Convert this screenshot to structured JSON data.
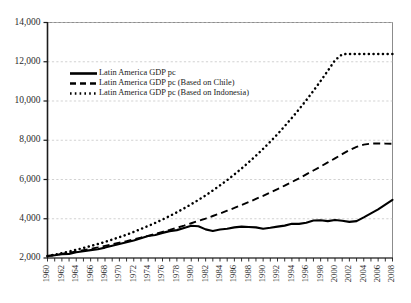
{
  "chart_data": {
    "type": "line",
    "title": "",
    "xlabel": "",
    "ylabel": "",
    "xlim": [
      1960,
      2008
    ],
    "ylim": [
      2000,
      14000
    ],
    "ytick_values": [
      2000,
      4000,
      6000,
      8000,
      10000,
      12000,
      14000
    ],
    "ytick_labels": [
      "2,000",
      "4,000",
      "6,000",
      "8,000",
      "10,000",
      "12,000",
      "14,000"
    ],
    "xtick_labels": [
      "1960",
      "1962",
      "1964",
      "1966",
      "1968",
      "1970",
      "1972",
      "1974",
      "1976",
      "1978",
      "1980",
      "1982",
      "1984",
      "1986",
      "1988",
      "1990",
      "1992",
      "1994",
      "1996",
      "1998",
      "2000",
      "2002",
      "2004",
      "2006",
      "2008"
    ],
    "xtick_label_years": [
      1960,
      1962,
      1964,
      1966,
      1968,
      1970,
      1972,
      1974,
      1976,
      1978,
      1980,
      1982,
      1984,
      1986,
      1988,
      1990,
      1992,
      1994,
      1996,
      1998,
      2000,
      2002,
      2004,
      2006,
      2008
    ],
    "x": [
      1960,
      1961,
      1962,
      1963,
      1964,
      1965,
      1966,
      1967,
      1968,
      1969,
      1970,
      1971,
      1972,
      1973,
      1974,
      1975,
      1976,
      1977,
      1978,
      1979,
      1980,
      1981,
      1982,
      1983,
      1984,
      1985,
      1986,
      1987,
      1988,
      1989,
      1990,
      1991,
      1992,
      1993,
      1994,
      1995,
      1996,
      1997,
      1998,
      1999,
      2000,
      2001,
      2002,
      2003,
      2004,
      2005,
      2006,
      2007,
      2008
    ],
    "grid": "horizontal-dashed",
    "legend_position": "upper-left-inset",
    "series": [
      {
        "name": "Latin America GDP pc",
        "style": "solid",
        "values": [
          2100,
          2140,
          2190,
          2210,
          2290,
          2340,
          2400,
          2450,
          2530,
          2620,
          2710,
          2800,
          2890,
          3010,
          3120,
          3170,
          3280,
          3370,
          3420,
          3530,
          3640,
          3620,
          3460,
          3380,
          3450,
          3490,
          3560,
          3600,
          3580,
          3560,
          3490,
          3540,
          3600,
          3650,
          3740,
          3740,
          3800,
          3910,
          3920,
          3880,
          3940,
          3900,
          3840,
          3880,
          4070,
          4270,
          4480,
          4720,
          4960
        ]
      },
      {
        "name": "Latin America GDP pc (Based on Chile)",
        "style": "dashed",
        "values": [
          2100,
          2150,
          2210,
          2270,
          2330,
          2400,
          2470,
          2540,
          2620,
          2700,
          2780,
          2860,
          2950,
          3040,
          3130,
          3230,
          3330,
          3430,
          3540,
          3650,
          3770,
          3890,
          4010,
          4140,
          4270,
          4410,
          4550,
          4700,
          4850,
          5010,
          5170,
          5340,
          5510,
          5690,
          5870,
          6060,
          6260,
          6460,
          6660,
          6870,
          7080,
          7290,
          7500,
          7660,
          7780,
          7830,
          7840,
          7830,
          7820
        ]
      },
      {
        "name": "Latin America GDP pc (Based on Indonesia)",
        "style": "dotted",
        "values": [
          2100,
          2170,
          2250,
          2330,
          2420,
          2510,
          2610,
          2710,
          2820,
          2940,
          3060,
          3190,
          3330,
          3480,
          3630,
          3790,
          3960,
          4140,
          4330,
          4530,
          4740,
          4960,
          5190,
          5440,
          5700,
          5970,
          6260,
          6560,
          6880,
          7210,
          7560,
          7930,
          8310,
          8720,
          9140,
          9580,
          10040,
          10520,
          11020,
          11540,
          12080,
          12380,
          12400,
          12400,
          12400,
          12400,
          12400,
          12400,
          12400
        ]
      }
    ]
  },
  "legend": {
    "entries": [
      {
        "label": "Latin America GDP pc",
        "marker": "solid-line-swatch"
      },
      {
        "label": "Latin America GDP pc (Based on Chile)",
        "marker": "dashed-line-swatch"
      },
      {
        "label": "Latin America GDP pc (Based on Indonesia)",
        "marker": "dotted-line-swatch"
      }
    ]
  },
  "colors": {
    "series": "#000000",
    "grid": "#bfbfbf",
    "frame": "#8c8c8c",
    "background": "#ffffff",
    "text": "#2b2b2b"
  }
}
